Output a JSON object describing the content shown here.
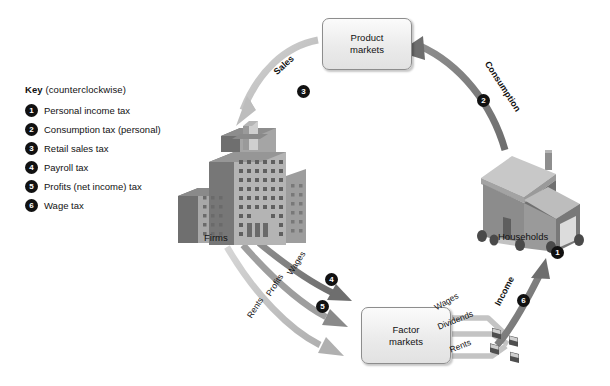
{
  "diagram": {
    "background_color": "#ffffff",
    "arrow_light_color": "#bdbdbd",
    "arrow_dark_color": "#7a7a7a",
    "badge_color": "#111111"
  },
  "key": {
    "title_bold": "Key",
    "title_rest": "(counterclockwise)",
    "items": [
      {
        "number": "1",
        "label": "Personal income tax"
      },
      {
        "number": "2",
        "label": "Consumption tax (personal)"
      },
      {
        "number": "3",
        "label": "Retail sales tax"
      },
      {
        "number": "4",
        "label": "Payroll tax"
      },
      {
        "number": "5",
        "label": "Profits (net income) tax"
      },
      {
        "number": "6",
        "label": "Wage tax"
      }
    ]
  },
  "nodes": {
    "product_markets": "Product\nmarkets",
    "product_markets_line1": "Product",
    "product_markets_line2": "markets",
    "factor_markets_line1": "Factor",
    "factor_markets_line2": "markets",
    "firms": "Firms",
    "households": "Households"
  },
  "flows": {
    "sales": "Sales",
    "consumption": "Consumption",
    "wages_firms_to_factor": "Wages",
    "profits": "Profits",
    "rents_firms_to_factor": "Rents",
    "wages_to_households": "Wages",
    "dividends": "Dividends",
    "rents_to_households": "Rents",
    "income": "Income"
  },
  "badges": {
    "b1": "1",
    "b2": "2",
    "b3": "3",
    "b4": "4",
    "b5": "5",
    "b6": "6"
  }
}
